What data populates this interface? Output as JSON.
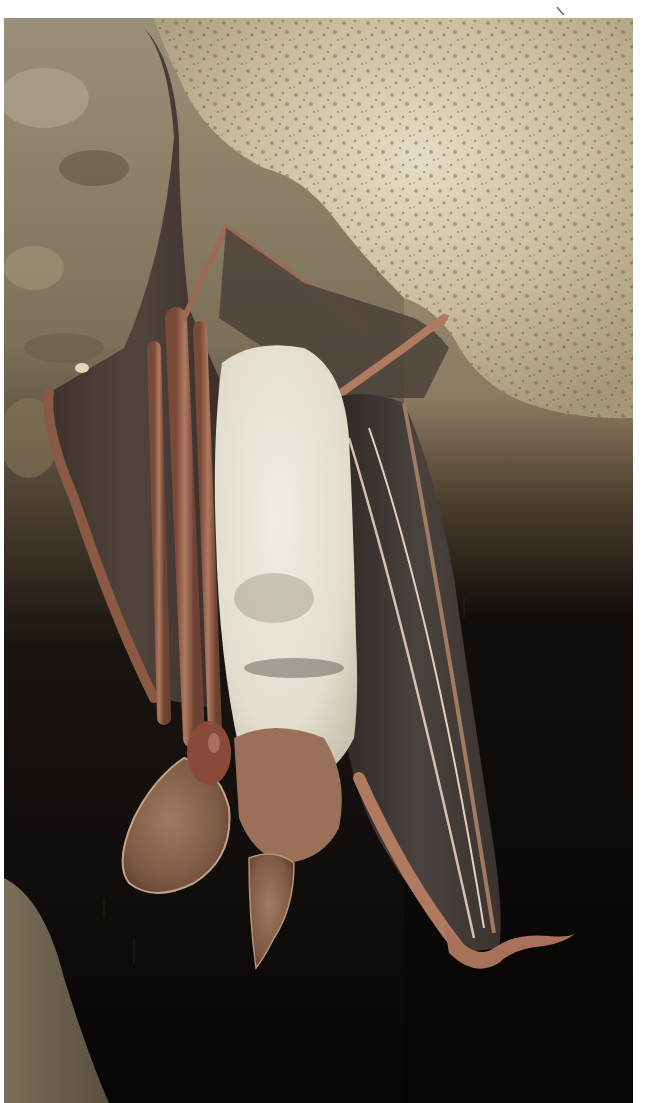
{
  "image": {
    "subject": "Long-eared bat hanging upside down from cave rock ceiling",
    "elements": [
      "rock-ceiling",
      "bat-wing-left",
      "bat-wing-right",
      "bat-fur-belly",
      "bat-ear-left",
      "bat-ear-right",
      "bat-foot-right",
      "cave-wall-left",
      "dark-background"
    ]
  },
  "colors": {
    "margin": "#ffffff",
    "rock_light": "#d8cdb0",
    "rock_mid": "#b8ab8a",
    "rock_dark": "#6f6450",
    "wall_left": "#8d8068",
    "background_dark": "#0a0807",
    "wing_membrane": "#4a3f3a",
    "wing_bone": "#a06850",
    "fur": "#e6e2d6",
    "ear": "#8a6048"
  }
}
